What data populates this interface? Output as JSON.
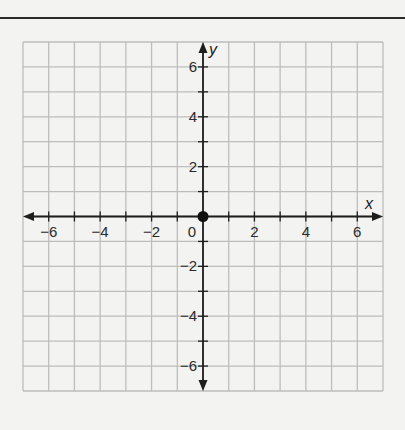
{
  "chart_data": {
    "type": "scatter",
    "title": "",
    "xlabel": "x",
    "ylabel": "y",
    "xlim": [
      -7,
      7
    ],
    "ylim": [
      -7,
      7
    ],
    "grid": true,
    "x_tick_labels": [
      "−6",
      "−4",
      "−2",
      "2",
      "4",
      "6"
    ],
    "x_tick_values": [
      -6,
      -4,
      -2,
      2,
      4,
      6
    ],
    "y_tick_labels": [
      "6",
      "4",
      "2",
      "−2",
      "−4",
      "−6"
    ],
    "y_tick_values": [
      6,
      4,
      2,
      -2,
      -4,
      -6
    ],
    "origin_label": "0",
    "series": [
      {
        "name": "point",
        "points": [
          [
            0,
            0
          ]
        ]
      }
    ]
  },
  "colors": {
    "grid": "#bdbdbd",
    "axis": "#1e1e1e",
    "point": "#111111",
    "background": "#f3f3f1"
  }
}
